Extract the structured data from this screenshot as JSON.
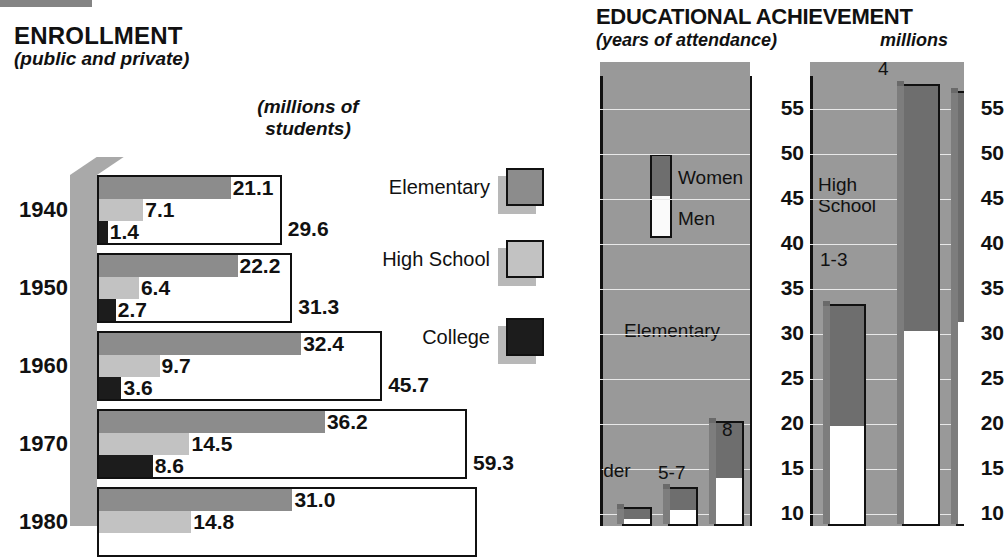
{
  "enrollment": {
    "title": "ENROLLMENT",
    "subtitle": "(public and private)",
    "units_line1": "(millions of",
    "units_line2": "students)",
    "legend": [
      {
        "label": "Elementary",
        "swatch": "elementary-swatch",
        "color": "#8c8c8c"
      },
      {
        "label": "High School",
        "swatch": "high-school-swatch",
        "color": "#c2c2c2"
      },
      {
        "label": "College",
        "swatch": "college-swatch",
        "color": "#1c1c1c"
      }
    ],
    "years": [
      {
        "year": "1940",
        "elementary": "21.1",
        "high_school": "7.1",
        "college": "1.4",
        "total": "29.6"
      },
      {
        "year": "1950",
        "elementary": "22.2",
        "high_school": "6.4",
        "college": "2.7",
        "total": "31.3"
      },
      {
        "year": "1960",
        "elementary": "32.4",
        "high_school": "9.7",
        "college": "3.6",
        "total": "45.7"
      },
      {
        "year": "1970",
        "elementary": "36.2",
        "high_school": "14.5",
        "college": "8.6",
        "total": "59.3"
      },
      {
        "year": "1980",
        "elementary": "31.0",
        "high_school": "14.8",
        "college": "",
        "total": ""
      }
    ]
  },
  "achievement": {
    "title": "EDUCATIONAL ACHIEVEMENT",
    "subtitle": "(years of attendance)",
    "units": "millions",
    "legend": {
      "women": "Women",
      "men": "Men"
    },
    "ticks": [
      "55",
      "50",
      "45",
      "40",
      "35",
      "30",
      "25",
      "20",
      "15",
      "10"
    ],
    "groups": [
      {
        "name": "Elementary",
        "bars": [
          {
            "label": "under\n5",
            "label_line1": "under",
            "label_line2": "5",
            "total": 10.8,
            "women": 5.6
          },
          {
            "label": "5-7",
            "total": 13.0,
            "women": 7.0
          },
          {
            "label": "8",
            "total": 20.3,
            "women": 10.6
          }
        ]
      },
      {
        "name": "High School",
        "name_line1": "High",
        "name_line2": "School",
        "bars": [
          {
            "label": "1-3",
            "total": 33.3,
            "women": 18.0
          },
          {
            "label": "4",
            "total": 57.8,
            "women": 32.0
          }
        ]
      }
    ]
  },
  "chart_data": [
    {
      "type": "bar",
      "title": "ENROLLMENT",
      "subtitle": "(public and private)",
      "ylabel": "",
      "xlabel": "(millions of students)",
      "orientation": "horizontal",
      "categories": [
        "1940",
        "1950",
        "1960",
        "1970",
        "1980"
      ],
      "series": [
        {
          "name": "Elementary",
          "values": [
            21.1,
            22.2,
            32.4,
            36.2,
            31.0
          ],
          "color": "#8c8c8c"
        },
        {
          "name": "High School",
          "values": [
            7.1,
            6.4,
            9.7,
            14.5,
            14.8
          ],
          "color": "#c2c2c2"
        },
        {
          "name": "College",
          "values": [
            1.4,
            2.7,
            3.6,
            8.6,
            null
          ],
          "color": "#1c1c1c"
        }
      ],
      "totals": [
        29.6,
        31.3,
        45.7,
        59.3,
        null
      ],
      "xlim": [
        0,
        59.3
      ],
      "grid": false,
      "legend_position": "right",
      "note": "1980 row is cut off at the bottom edge of the screenshot"
    },
    {
      "type": "bar",
      "title": "EDUCATIONAL ACHIEVEMENT",
      "subtitle": "(years of attendance)",
      "ylabel": "millions",
      "orientation": "vertical",
      "stacked": true,
      "ylim": [
        10,
        58
      ],
      "yticks": [
        55,
        50,
        45,
        40,
        35,
        30,
        25,
        20,
        15,
        10
      ],
      "grid": true,
      "groups": [
        "Elementary",
        "High School"
      ],
      "categories": [
        "under 5",
        "5-7",
        "8",
        "1-3",
        "4"
      ],
      "series": [
        {
          "name": "Women",
          "values": [
            5.6,
            7.0,
            10.6,
            18.0,
            32.0
          ],
          "color": "#6e6e6e"
        },
        {
          "name": "Men",
          "values": [
            5.2,
            6.0,
            9.7,
            15.3,
            25.8
          ],
          "color": "#fafafa"
        }
      ],
      "legend_position": "inside-left",
      "note": "values estimated from gridlines; third group is cut off at the right edge"
    }
  ]
}
